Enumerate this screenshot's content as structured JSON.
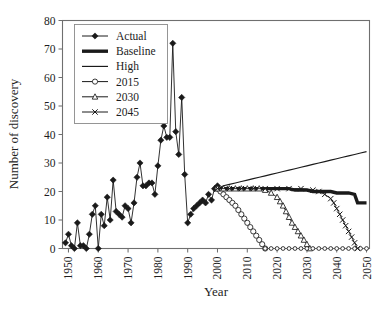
{
  "chart_data": {
    "type": "line",
    "title": "",
    "xlabel": "Year",
    "ylabel": "Number of discovery",
    "xlim": [
      1948,
      2051
    ],
    "ylim": [
      0,
      80
    ],
    "xticks": [
      1950,
      1960,
      1970,
      1980,
      1990,
      2000,
      2010,
      2020,
      2030,
      2040,
      2050
    ],
    "yticks": [
      0,
      10,
      20,
      30,
      40,
      50,
      60,
      70,
      80
    ],
    "grid": false,
    "legend_position": "top-left",
    "series": [
      {
        "name": "Actual",
        "marker": "filled-diamond",
        "style": "thin-line-with-markers",
        "x": [
          1949,
          1950,
          1951,
          1952,
          1953,
          1954,
          1955,
          1956,
          1957,
          1958,
          1959,
          1960,
          1961,
          1962,
          1963,
          1964,
          1965,
          1966,
          1967,
          1968,
          1969,
          1970,
          1971,
          1972,
          1973,
          1974,
          1975,
          1976,
          1977,
          1978,
          1979,
          1980,
          1981,
          1982,
          1983,
          1984,
          1985,
          1986,
          1987,
          1988,
          1989,
          1990,
          1991,
          1992,
          1993,
          1994,
          1995,
          1996,
          1997,
          1998,
          1999,
          2000
        ],
        "values": [
          2,
          5,
          1,
          0,
          9,
          1,
          1,
          0,
          5,
          12,
          15,
          0,
          12,
          8,
          18,
          10,
          24,
          13,
          12,
          11,
          15,
          14,
          9,
          16,
          25,
          30,
          22,
          22,
          23,
          23,
          19,
          29,
          38,
          43,
          39,
          39,
          72,
          41,
          33,
          53,
          26,
          9,
          12,
          14,
          15,
          16,
          17,
          16,
          19,
          17,
          21,
          22
        ]
      },
      {
        "name": "Baseline",
        "marker": "none",
        "style": "thick-line",
        "x": [
          2000,
          2002,
          2004,
          2006,
          2008,
          2010,
          2012,
          2014,
          2016,
          2018,
          2020,
          2022,
          2024,
          2026,
          2028,
          2030,
          2032,
          2034,
          2036,
          2038,
          2040,
          2042,
          2044,
          2046,
          2047,
          2050
        ],
        "values": [
          21,
          21,
          21,
          21,
          21,
          21,
          21,
          21,
          21,
          21,
          21,
          21,
          21,
          20.5,
          20.5,
          20.5,
          20,
          20,
          20,
          20,
          19.5,
          19.5,
          19.5,
          19,
          16,
          16
        ]
      },
      {
        "name": "High",
        "marker": "none",
        "style": "thin-line",
        "x": [
          2000,
          2002,
          2004,
          2006,
          2008,
          2010,
          2012,
          2014,
          2016,
          2018,
          2020,
          2022,
          2024,
          2026,
          2028,
          2030,
          2032,
          2034,
          2036,
          2038,
          2040,
          2042,
          2044,
          2046,
          2048,
          2050
        ],
        "values": [
          21,
          22,
          22.5,
          23,
          23.5,
          24,
          24.5,
          25,
          25.5,
          26,
          26.5,
          27,
          27.5,
          28,
          28.5,
          29,
          29.5,
          30,
          30.5,
          31,
          31.5,
          32,
          32.5,
          33,
          33.5,
          34
        ]
      },
      {
        "name": "2015",
        "marker": "open-circle",
        "style": "thin-line-with-markers",
        "x": [
          2000,
          2001,
          2002,
          2003,
          2004,
          2005,
          2006,
          2007,
          2008,
          2009,
          2010,
          2011,
          2012,
          2013,
          2014,
          2015,
          2016
        ],
        "values": [
          21,
          20,
          19,
          18,
          17,
          16,
          15,
          13.5,
          12,
          10.5,
          9,
          7.5,
          6,
          4.5,
          3,
          1.5,
          0
        ]
      },
      {
        "name": "2030",
        "marker": "open-triangle",
        "style": "thin-line-with-markers",
        "x": [
          2000,
          2002,
          2004,
          2006,
          2008,
          2010,
          2012,
          2014,
          2016,
          2018,
          2020,
          2021,
          2022,
          2023,
          2024,
          2025,
          2026,
          2027,
          2028,
          2029,
          2030,
          2031
        ],
        "values": [
          21,
          21,
          21,
          21,
          21,
          21,
          21,
          21,
          20.5,
          19.5,
          18,
          16.5,
          15,
          13,
          11,
          9,
          7.5,
          6,
          4.5,
          3,
          1.5,
          0
        ]
      },
      {
        "name": "2045",
        "marker": "cross-x",
        "style": "thin-line-with-markers",
        "x": [
          2000,
          2004,
          2008,
          2012,
          2016,
          2020,
          2024,
          2028,
          2032,
          2034,
          2036,
          2038,
          2039,
          2040,
          2041,
          2042,
          2043,
          2044,
          2045,
          2046,
          2047
        ],
        "values": [
          21,
          21,
          21,
          21,
          21,
          21,
          21,
          21,
          20.5,
          20,
          19,
          17.5,
          16,
          14,
          12,
          10,
          8,
          6,
          4,
          2,
          0
        ]
      },
      {
        "name": "zero-baseline-markers",
        "marker": "open-circle-small",
        "style": "markers-only",
        "x": [
          2016,
          2018,
          2020,
          2022,
          2024,
          2026,
          2028,
          2030,
          2032,
          2034,
          2036,
          2038,
          2040,
          2042,
          2044,
          2046,
          2048,
          2050
        ],
        "values": [
          0,
          0,
          0,
          0,
          0,
          0,
          0,
          0,
          0,
          0,
          0,
          0,
          0,
          0,
          0,
          0,
          0,
          0
        ]
      }
    ],
    "legend": [
      {
        "label": "Actual",
        "marker": "filled-diamond",
        "style": "thin-line-with-markers"
      },
      {
        "label": "Baseline",
        "marker": "none",
        "style": "thick-line"
      },
      {
        "label": "High",
        "marker": "none",
        "style": "thin-line"
      },
      {
        "label": "2015",
        "marker": "open-circle",
        "style": "thin-line-with-markers"
      },
      {
        "label": "2030",
        "marker": "open-triangle",
        "style": "thin-line-with-markers"
      },
      {
        "label": "2045",
        "marker": "cross-x",
        "style": "thin-line-with-markers"
      }
    ],
    "colors": {
      "series": "#1a1a1a",
      "axis": "#6f6f6f",
      "text": "#1d1d1d",
      "background": "#ffffff"
    }
  }
}
